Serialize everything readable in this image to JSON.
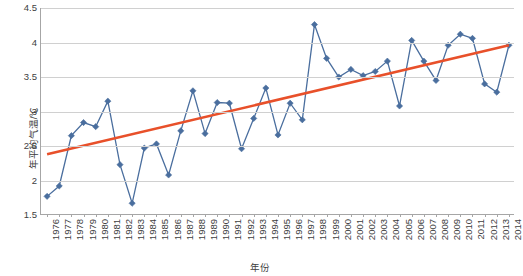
{
  "chart_data": {
    "type": "line",
    "title": "",
    "xlabel": "年份",
    "ylabel": "年平均气温/℃",
    "xlim": [
      1976,
      2014
    ],
    "ylim": [
      1.5,
      4.5
    ],
    "ytick_labels": [
      "1.5",
      "2",
      "2.5",
      "3",
      "3.5",
      "4",
      "4.5"
    ],
    "ytick_values": [
      1.5,
      2,
      2.5,
      3,
      3.5,
      4,
      4.5
    ],
    "grid": true,
    "legend": "none",
    "x": [
      1976,
      1977,
      1978,
      1979,
      1980,
      1981,
      1982,
      1983,
      1984,
      1985,
      1986,
      1987,
      1988,
      1989,
      1990,
      1991,
      1992,
      1993,
      1994,
      1995,
      1996,
      1997,
      1998,
      1999,
      2000,
      2001,
      2002,
      2003,
      2004,
      2005,
      2006,
      2007,
      2008,
      2009,
      2010,
      2011,
      2012,
      2013,
      2014
    ],
    "xtick_labels": [
      "1976",
      "1977",
      "1978",
      "1979",
      "1980",
      "1981",
      "1982",
      "1983",
      "1984",
      "1985",
      "1986",
      "1987",
      "1988",
      "1989",
      "1990",
      "1991",
      "1992",
      "1993",
      "1994",
      "1995",
      "1996",
      "1997",
      "1998",
      "1999",
      "2000",
      "2001",
      "2002",
      "2003",
      "2004",
      "2005",
      "2006",
      "2007",
      "2008",
      "2009",
      "2010",
      "2011",
      "2012",
      "2013",
      "2014"
    ],
    "series": [
      {
        "name": "年平均气温",
        "type": "line",
        "color": "#4A6E9E",
        "marker": "diamond",
        "values": [
          1.77,
          1.92,
          2.65,
          2.84,
          2.78,
          3.15,
          2.23,
          1.67,
          2.47,
          2.53,
          2.08,
          2.72,
          3.3,
          2.68,
          3.13,
          3.12,
          2.46,
          2.9,
          3.34,
          2.66,
          3.12,
          2.88,
          4.26,
          3.77,
          3.5,
          3.61,
          3.52,
          3.58,
          3.73,
          3.08,
          4.03,
          3.73,
          3.45,
          3.96,
          4.12,
          4.06,
          3.4,
          3.28,
          3.96
        ]
      },
      {
        "name": "线性趋势线",
        "type": "trendline",
        "color": "#E8502A",
        "start_value": 2.38,
        "end_value": 3.96
      }
    ]
  },
  "axes": {
    "y_title": "年平均气温/℃",
    "x_title": "年份"
  }
}
